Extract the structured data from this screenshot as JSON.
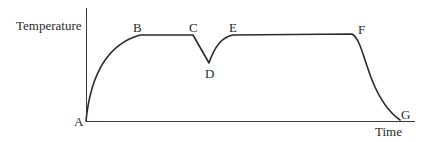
{
  "diagram": {
    "type": "temperature-time curve",
    "axes": {
      "y_label": "Temperature",
      "x_label": "Time"
    },
    "points": [
      {
        "label": "A",
        "x": 86,
        "y": 121
      },
      {
        "label": "B",
        "x": 140,
        "y": 35
      },
      {
        "label": "C",
        "x": 193,
        "y": 35
      },
      {
        "label": "D",
        "x": 209,
        "y": 63
      },
      {
        "label": "E",
        "x": 233,
        "y": 35
      },
      {
        "label": "F",
        "x": 352,
        "y": 34
      },
      {
        "label": "G",
        "x": 400,
        "y": 120
      }
    ],
    "segments": [
      {
        "from": "A",
        "to": "B",
        "shape": "concave rise"
      },
      {
        "from": "B",
        "to": "C",
        "shape": "flat"
      },
      {
        "from": "C",
        "to": "D",
        "shape": "straight drop"
      },
      {
        "from": "D",
        "to": "E",
        "shape": "curved rise"
      },
      {
        "from": "E",
        "to": "F",
        "shape": "flat"
      },
      {
        "from": "F",
        "to": "G",
        "shape": "curved fall"
      }
    ]
  }
}
